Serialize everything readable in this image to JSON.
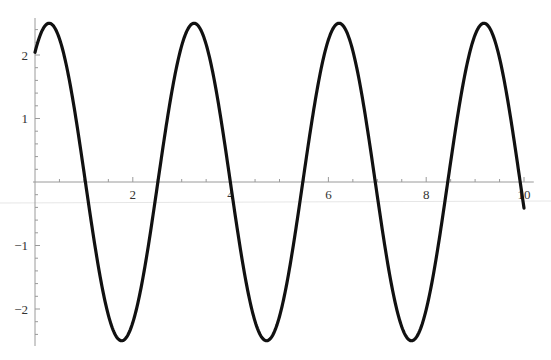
{
  "chart_data": {
    "type": "line",
    "title": "",
    "xlabel": "",
    "ylabel": "",
    "function_estimate": "y = 2.5 cos(2.12 (x - 0.29))",
    "xlim": [
      0,
      10
    ],
    "ylim": [
      -2.5,
      2.5
    ],
    "grid": false,
    "legend": null,
    "x_ticks": [
      2,
      4,
      6,
      8,
      10
    ],
    "x_tick_labels": [
      "2",
      "4",
      "6",
      "8",
      "10"
    ],
    "y_ticks": [
      -2,
      -1,
      1,
      2
    ],
    "y_tick_labels": [
      "−2",
      "−1",
      "1",
      "2"
    ],
    "minor_tick_step_x": 0.5,
    "minor_tick_step_y": 0.2,
    "series": [
      {
        "name": "curve",
        "color": "#111111",
        "amplitude": 2.5,
        "angular_frequency": 2.12,
        "phase_shift": 0.29,
        "x": [
          0,
          0.29,
          1.03,
          1.77,
          2.51,
          3.25,
          3.99,
          4.73,
          5.47,
          6.21,
          6.96,
          7.7,
          8.44,
          9.18,
          9.92,
          10
        ],
        "y": [
          2.04,
          2.5,
          0,
          -2.5,
          0,
          2.5,
          0,
          -2.5,
          0,
          2.5,
          0,
          -2.5,
          0,
          2.5,
          0,
          -0.41
        ]
      }
    ]
  },
  "axes": {
    "origin_px": [
      35,
      182
    ],
    "px_per_unit_x": 48.9,
    "px_per_unit_y": 63.5
  },
  "colors": {
    "curve": "#111111",
    "axis": "#9a9a9a",
    "label": "#333333",
    "artifact_line": "#e4e4e4"
  }
}
